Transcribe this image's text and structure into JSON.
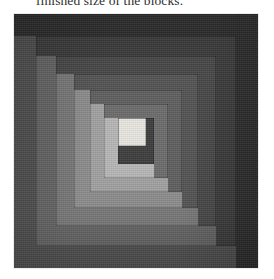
{
  "caption": {
    "text": "finished size of the blocks."
  },
  "figure": {
    "name": "log-cabin-quilt-block-photograph",
    "width": 244,
    "height": 254,
    "background_color": "#3c3c3c",
    "center": {
      "label": "center-square",
      "color": "#e8e6e0",
      "x": 104,
      "y": 104,
      "w": 28,
      "h": 28
    },
    "rings": [
      {
        "index": 1,
        "label": "outer-border-ring",
        "dark_color": "#2b2b2b",
        "light_color": "#4e4e4e",
        "inset": 0,
        "log_width": 22
      },
      {
        "index": 2,
        "label": "ring-2",
        "dark_color": "#3a3a3a",
        "light_color": "#636363",
        "inset": 22,
        "log_width": 20
      },
      {
        "index": 3,
        "label": "ring-3",
        "dark_color": "#464646",
        "light_color": "#767676",
        "inset": 42,
        "log_width": 18
      },
      {
        "index": 4,
        "label": "ring-4",
        "dark_color": "#525252",
        "light_color": "#8b8b8b",
        "inset": 60,
        "log_width": 16
      },
      {
        "index": 5,
        "label": "ring-5",
        "dark_color": "#5e5e5e",
        "light_color": "#a0a0a0",
        "inset": 76,
        "log_width": 14
      },
      {
        "index": 6,
        "label": "ring-6",
        "dark_color": "#6b6b6b",
        "light_color": "#b6b6b6",
        "inset": 90,
        "log_width": 14
      }
    ],
    "palette": {
      "darkest": "#2b2b2b",
      "lightest": "#e8e6e0",
      "paper": "#ffffff",
      "ink": "#2e2e2e"
    }
  }
}
